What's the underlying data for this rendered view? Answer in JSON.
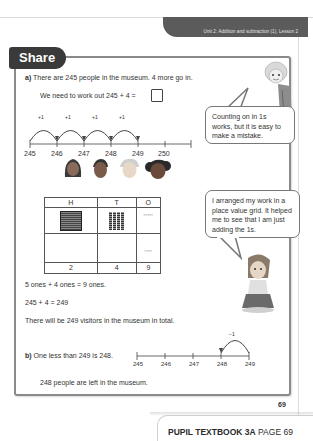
{
  "header": {
    "unit_banner": "Unit 2: Addition and subtraction (1), Lesson 2"
  },
  "section": {
    "tab_label": "Share"
  },
  "part_a": {
    "letter": "a)",
    "problem": "There are 245 people in the museum. 4 more go in.",
    "work_out": "We need to work out 245 + 4 =",
    "number_line": {
      "ticks": [
        "245",
        "246",
        "247",
        "248",
        "249",
        "250"
      ],
      "jumps": [
        "+1",
        "+1",
        "+1",
        "+1"
      ]
    },
    "bubble_1": "Counting on in 1s works, but it is easy to make a mistake.",
    "place_value_table": {
      "headers": [
        "H",
        "T",
        "O"
      ],
      "digits": [
        "2",
        "4",
        "9"
      ]
    },
    "bubble_2": "I arranged my work in a place value grid. It helped me to see that I am just adding the 1s.",
    "line_1": "5 ones + 4 ones = 9 ones.",
    "line_2": "245 + 4 = 249",
    "line_3": "There will be 249 visitors in the museum in total."
  },
  "part_b": {
    "letter": "b)",
    "statement": "One less than 249 is 248.",
    "number_line": {
      "ticks": [
        "245",
        "246",
        "247",
        "248",
        "249"
      ],
      "jump": "−1"
    },
    "conclusion": "248 people are left in the museum."
  },
  "footer": {
    "page_number": "69",
    "book_label": "PUPIL TEXTBOOK 3A",
    "page_label": "PAGE 69"
  }
}
